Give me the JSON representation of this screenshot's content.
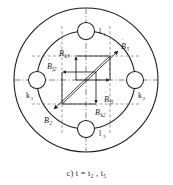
{
  "figure": {
    "caption": "c) t = t₂ , t₅",
    "caption_label": "c)",
    "caption_expr": "t = t₂ , t₅",
    "type": "machine-cross-section-phasor-diagram",
    "colors": {
      "outline": "#1c1c1c",
      "construction": "#555555",
      "axis": "#555555",
      "text": "#1c1c1c",
      "background": "#ffffff"
    }
  },
  "geometry": {
    "outer_circle": {
      "cx": 86,
      "cy": 80,
      "r": 72
    },
    "inner_circle": {
      "cx": 86,
      "cy": 80,
      "r": 49
    },
    "slot_radius": 8.5
  },
  "slots": [
    {
      "id": "l1",
      "label": "l",
      "sub": "1",
      "position": "top",
      "cx": 86,
      "cy": 31
    },
    {
      "id": "k2",
      "label": "k",
      "sub": "2",
      "position": "right",
      "cx": 135,
      "cy": 80
    },
    {
      "id": "l2",
      "label": "l",
      "sub": "2",
      "position": "bottom",
      "cx": 86,
      "cy": 129
    },
    {
      "id": "k1",
      "label": "k",
      "sub": "1",
      "position": "left",
      "cx": 37,
      "cy": 80
    }
  ],
  "slot_labels": [
    {
      "id": "l1-label",
      "text": "l",
      "sub": "1",
      "x": 99,
      "y": 33
    },
    {
      "id": "k2-label",
      "text": "k",
      "sub": "2",
      "x": 140,
      "y": 97
    },
    {
      "id": "l2-label",
      "text": "l",
      "sub": "2",
      "x": 99,
      "y": 135
    },
    {
      "id": "k1-label",
      "text": "k",
      "sub": "1",
      "x": 28,
      "y": 97
    }
  ],
  "phasors": [
    {
      "id": "B5",
      "symbol": "B",
      "sub": "5",
      "accent": "dot",
      "direction": "up-right",
      "from": {
        "x": 62,
        "y": 104
      },
      "to": {
        "x": 120,
        "y": 50
      },
      "label": {
        "x": 122,
        "y": 47
      }
    },
    {
      "id": "B2",
      "symbol": "B",
      "sub": "2",
      "accent": "dot",
      "direction": "down-left",
      "from": {
        "x": 110,
        "y": 56
      },
      "to": {
        "x": 52,
        "y": 110
      },
      "label": {
        "x": 44,
        "y": 122
      }
    }
  ],
  "components": [
    {
      "id": "Bk3",
      "symbol": "B",
      "sub": "k3",
      "accent": "dot",
      "label": {
        "x": 59,
        "y": 55
      }
    },
    {
      "id": "Bf2",
      "symbol": "B",
      "sub": "f2",
      "accent": "dot",
      "label": {
        "x": 47,
        "y": 68
      }
    },
    {
      "id": "Bf5",
      "symbol": "B",
      "sub": "f5",
      "accent": "dot",
      "label": {
        "x": 104,
        "y": 101
      }
    },
    {
      "id": "Bk2",
      "symbol": "B",
      "sub": "k2",
      "accent": "dot",
      "label": {
        "x": 95,
        "y": 114
      }
    }
  ],
  "axes": [
    {
      "id": "horizontal-axis",
      "orientation": "horizontal",
      "style": "dash-dot"
    },
    {
      "id": "vertical-axis",
      "orientation": "vertical",
      "style": "dash-dot"
    }
  ]
}
